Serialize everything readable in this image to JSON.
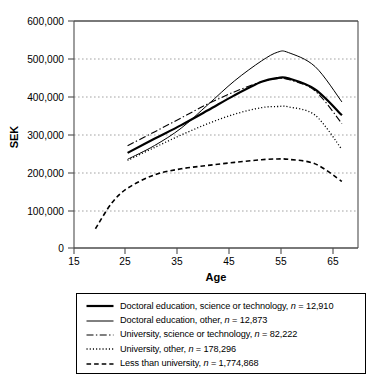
{
  "chart_data": {
    "type": "line",
    "title": "",
    "xlabel": "Age",
    "ylabel": "SEK",
    "xlim": [
      15,
      68
    ],
    "ylim": [
      0,
      600000
    ],
    "xticks": [
      15,
      25,
      35,
      45,
      55,
      65
    ],
    "xtick_labels": [
      "15",
      "25",
      "35",
      "45",
      "55",
      "65"
    ],
    "yticks": [
      0,
      100000,
      200000,
      300000,
      400000,
      500000,
      600000
    ],
    "ytick_labels": [
      "0",
      "100,000",
      "200,000",
      "300,000",
      "400,000",
      "500,000",
      "600,000"
    ],
    "grid": "horizontal-dotted",
    "legend_position": "below-plot",
    "series": [
      {
        "name": "Doctoral education, science or technology",
        "n": "12,910",
        "legend_label": "Doctoral education, science or technology, ",
        "n_label": " = 12,910",
        "style": "solid-thick",
        "x": [
          25,
          30,
          35,
          40,
          45,
          50,
          53,
          55,
          60,
          65
        ],
        "values": [
          253000,
          290000,
          326000,
          365000,
          405000,
          440000,
          450000,
          449000,
          420000,
          352000
        ]
      },
      {
        "name": "Doctoral education, other",
        "n": "12,873",
        "legend_label": "Doctoral education, other, ",
        "n_label": " = 12,873",
        "style": "solid-thin",
        "x": [
          25,
          30,
          35,
          40,
          45,
          50,
          53,
          55,
          60,
          65
        ],
        "values": [
          236000,
          272000,
          318000,
          380000,
          443000,
          495000,
          518000,
          517000,
          480000,
          387000
        ]
      },
      {
        "name": "University, science or technology",
        "n": "82,222",
        "legend_label": "University, science or technology, ",
        "n_label": " = 82,222",
        "style": "dash-dot",
        "x": [
          25,
          30,
          35,
          40,
          45,
          50,
          53,
          55,
          60,
          65
        ],
        "values": [
          272000,
          308000,
          345000,
          382000,
          414000,
          440000,
          448000,
          446000,
          416000,
          330000
        ]
      },
      {
        "name": "University, other",
        "n": "178,296",
        "legend_label": "University, other, ",
        "n_label": " = 178,296",
        "style": "dotted",
        "x": [
          25,
          30,
          35,
          40,
          45,
          50,
          53,
          55,
          60,
          65
        ],
        "values": [
          233000,
          267000,
          300000,
          330000,
          355000,
          372000,
          375000,
          374000,
          352000,
          262000
        ]
      },
      {
        "name": "Less than university",
        "n": "1,774,868",
        "legend_label": "Less than university, ",
        "n_label": " = 1,774,868",
        "style": "dashed",
        "x": [
          19,
          22,
          25,
          30,
          35,
          40,
          45,
          50,
          53,
          55,
          60,
          65
        ],
        "values": [
          52000,
          120000,
          160000,
          195000,
          211000,
          220000,
          228000,
          235000,
          237000,
          236000,
          224000,
          178000
        ]
      }
    ]
  },
  "legend": {
    "italic_n": "n",
    "items": [
      {
        "label": "Doctoral education, science or technology, ",
        "n": " = 12,910"
      },
      {
        "label": "Doctoral education, other, ",
        "n": " = 12,873"
      },
      {
        "label": "University, science or technology, ",
        "n": " = 82,222"
      },
      {
        "label": "University, other, ",
        "n": " = 178,296"
      },
      {
        "label": "Less than university, ",
        "n": " = 1,774,868"
      }
    ]
  },
  "colors": {
    "line": "#000000",
    "grid": "#aaaaaa",
    "axis": "#555555",
    "background": "#ffffff"
  }
}
